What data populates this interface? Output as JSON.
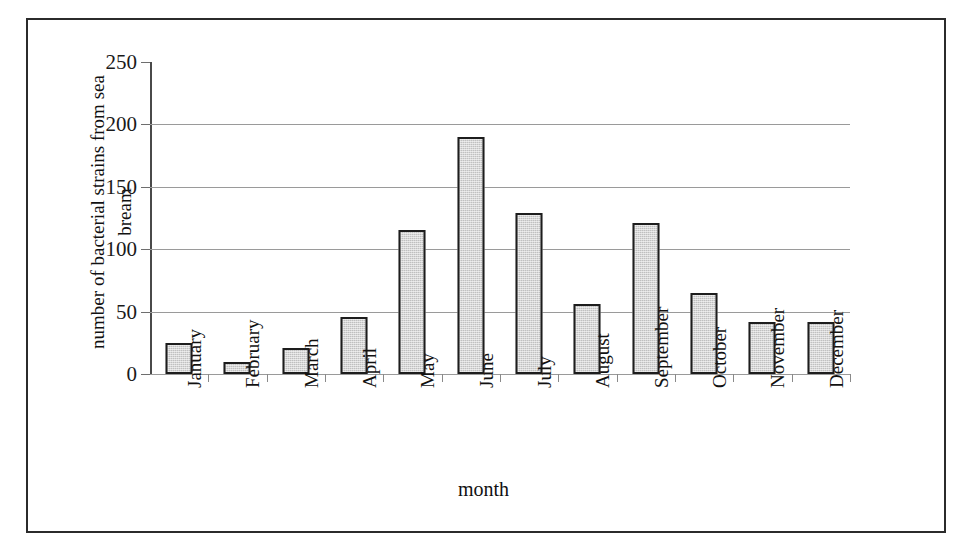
{
  "chart_data": {
    "type": "bar",
    "title": "",
    "xlabel": "month",
    "ylabel": "number of bacterial strains from sea bream",
    "ylabel_lines": [
      "number of bacterial strains from sea",
      "bream"
    ],
    "categories": [
      "January",
      "February",
      "March",
      "April",
      "May",
      "June",
      "July",
      "August",
      "September",
      "October",
      "November",
      "December"
    ],
    "values": [
      25,
      10,
      21,
      46,
      115,
      190,
      129,
      56,
      121,
      65,
      42,
      42
    ],
    "ylim": [
      0,
      250
    ],
    "yticks": [
      0,
      50,
      100,
      150,
      200,
      250
    ],
    "ytick_labels": [
      "0",
      "50",
      "100",
      "150",
      "200",
      "250"
    ],
    "grid": true,
    "legend": false,
    "colors": {
      "bar_fill": "#d6d6d6",
      "bar_border": "#1d1d1d",
      "gridline": "#9a9a9a",
      "axis": "#4a4a4a",
      "frame": "#2b2b2b",
      "background": "#ffffff",
      "text": "#111111"
    }
  }
}
